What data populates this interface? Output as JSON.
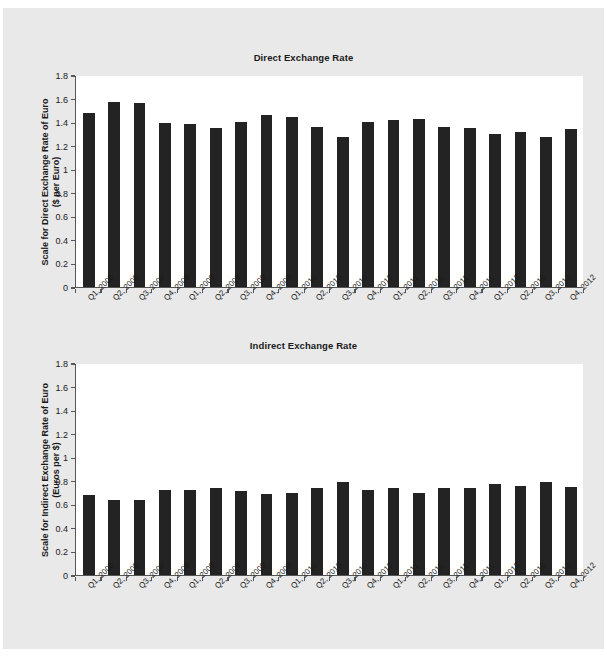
{
  "figure_top": {
    "title": "Direct Exchange Rate",
    "ylabel_line1": "Scale for Direct Exchange Rate of Euro",
    "ylabel_line2": "($ per Euro)"
  },
  "figure_bottom": {
    "title": "Indirect Exchange Rate",
    "ylabel_line1": "Scale for Indirect Exchange Rate of Euro",
    "ylabel_line2": "(Euros per $)"
  },
  "colors": {
    "bar": "#232323",
    "axis": "#555555",
    "plot_background": "#ffffff",
    "page_background": "#e9e9e9",
    "text": "#1a1a1a"
  },
  "chart_data": [
    {
      "type": "bar",
      "title": "Direct Exchange Rate",
      "xlabel": "",
      "ylabel": "Scale for Direct Exchange Rate of Euro ($ per Euro)",
      "ylim": [
        0,
        1.8
      ],
      "yticks": [
        0,
        0.2,
        0.4,
        0.6,
        0.8,
        1,
        1.2,
        1.4,
        1.6,
        1.8
      ],
      "ytick_labels": [
        "0",
        "0.2",
        "0.4",
        "0.6",
        "0.8",
        "1",
        "1.2",
        "1.4",
        "1.6",
        "1.8"
      ],
      "grid": false,
      "legend": "none",
      "categories": [
        "Q1, 2008",
        "Q2, 2008",
        "Q3, 2008",
        "Q4, 2008",
        "Q1, 2009",
        "Q2, 2009",
        "Q3, 2009",
        "Q4, 2009",
        "Q1, 2010",
        "Q2, 2010",
        "Q3, 2010",
        "Q4, 2010",
        "Q1, 2011",
        "Q2, 2011",
        "Q3, 2011",
        "Q4, 2011",
        "Q1, 2012",
        "Q2, 2012",
        "Q3, 2012",
        "Q4, 2012"
      ],
      "values": [
        1.48,
        1.57,
        1.56,
        1.39,
        1.38,
        1.35,
        1.4,
        1.46,
        1.44,
        1.36,
        1.27,
        1.4,
        1.42,
        1.43,
        1.36,
        1.35,
        1.3,
        1.32,
        1.27,
        1.34
      ]
    },
    {
      "type": "bar",
      "title": "Indirect Exchange Rate",
      "xlabel": "",
      "ylabel": "Scale for Indirect Exchange Rate of Euro (Euros per $)",
      "ylim": [
        0,
        1.8
      ],
      "yticks": [
        0,
        0.2,
        0.4,
        0.6,
        0.8,
        1,
        1.2,
        1.4,
        1.6,
        1.8
      ],
      "ytick_labels": [
        "0",
        "0.2",
        "0.4",
        "0.6",
        "0.8",
        "1",
        "1.2",
        "1.4",
        "1.6",
        "1.8"
      ],
      "grid": false,
      "legend": "none",
      "categories": [
        "Q1, 2008",
        "Q2, 2008",
        "Q3, 2008",
        "Q4, 2008",
        "Q1, 2009",
        "Q2, 2009",
        "Q3, 2009",
        "Q4, 2009",
        "Q1, 2010",
        "Q2, 2010",
        "Q3, 2010",
        "Q4, 2010",
        "Q1, 2011",
        "Q2, 2011",
        "Q3, 2011",
        "Q4, 2011",
        "Q1, 2012",
        "Q2, 2012",
        "Q3, 2012",
        "Q4, 2012"
      ],
      "values": [
        0.68,
        0.64,
        0.64,
        0.72,
        0.72,
        0.74,
        0.71,
        0.69,
        0.7,
        0.74,
        0.79,
        0.72,
        0.74,
        0.7,
        0.74,
        0.74,
        0.77,
        0.76,
        0.79,
        0.75
      ]
    }
  ]
}
